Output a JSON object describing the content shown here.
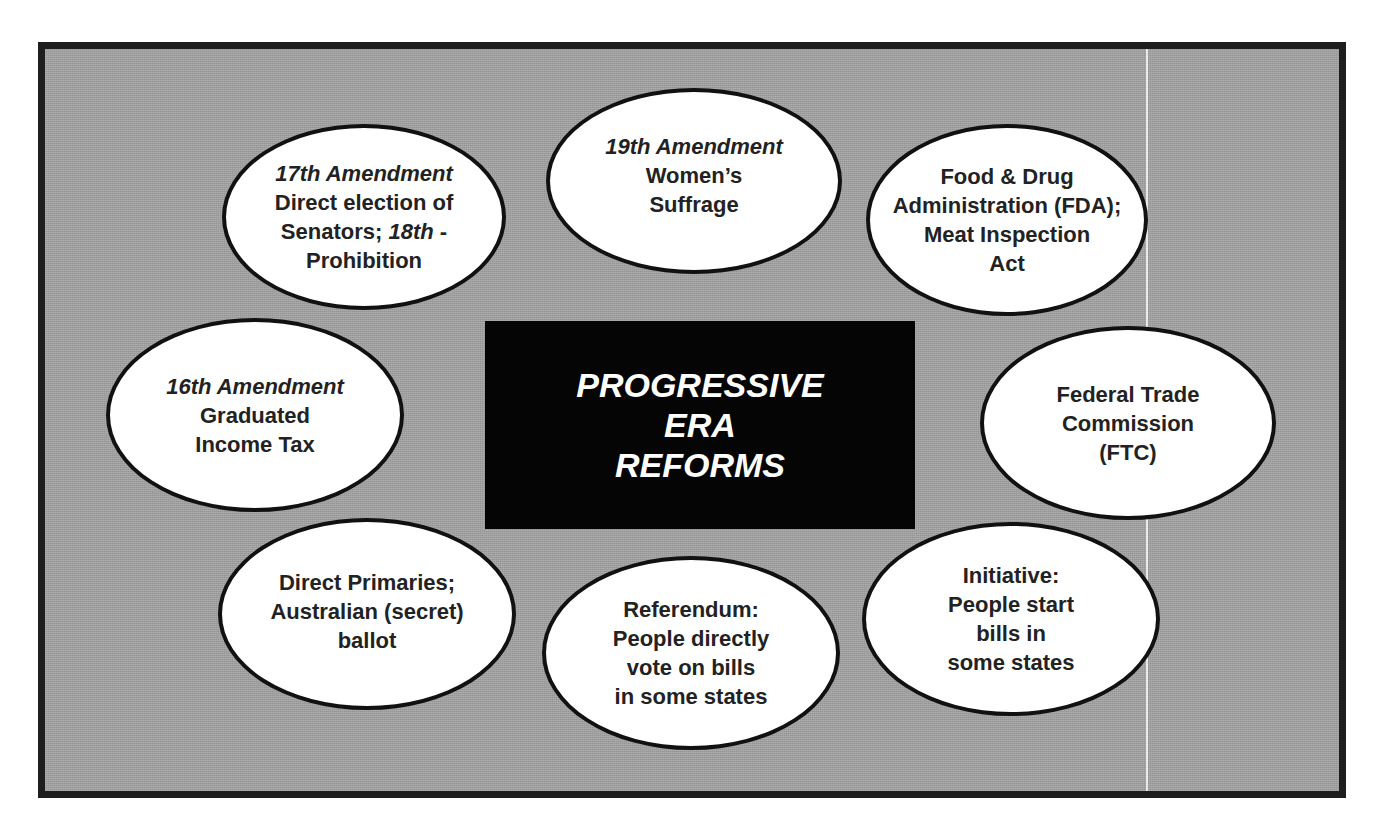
{
  "diagram": {
    "title": {
      "lines": [
        "PROGRESSIVE",
        "ERA",
        "REFORMS"
      ]
    },
    "colors": {
      "background": "#a3a3a3",
      "frame_border": "#1e1e1e",
      "title_box": "#050505",
      "title_text": "#ffffff",
      "oval_fill": "#ffffff",
      "oval_border": "#111111",
      "oval_text": "#222222"
    },
    "ovals": [
      {
        "id": "17th-18th-amendment",
        "lines": [
          {
            "italic": "17th Amendment",
            "text": ""
          },
          {
            "italic": "",
            "text": "Direct election of"
          },
          {
            "italic_prefix": "",
            "text": "Senators; ",
            "italic": "18th",
            "suffix": " -"
          },
          {
            "italic": "",
            "text": "Prohibition"
          }
        ]
      },
      {
        "id": "19th-amendment",
        "lines": [
          {
            "italic": "19th Amendment",
            "text": ""
          },
          {
            "italic": "",
            "text": "Women’s"
          },
          {
            "italic": "",
            "text": "Suffrage"
          }
        ]
      },
      {
        "id": "fda",
        "lines": [
          {
            "text": "Food & Drug"
          },
          {
            "text": "Administration (FDA);"
          },
          {
            "text": "Meat Inspection"
          },
          {
            "text": "Act"
          }
        ]
      },
      {
        "id": "16th-amendment",
        "lines": [
          {
            "italic": "16th Amendment",
            "text": ""
          },
          {
            "text": "Graduated"
          },
          {
            "text": "Income Tax"
          }
        ]
      },
      {
        "id": "ftc",
        "lines": [
          {
            "text": "Federal Trade"
          },
          {
            "text": "Commission"
          },
          {
            "text": "(FTC)"
          }
        ]
      },
      {
        "id": "direct-primaries",
        "lines": [
          {
            "text": "Direct Primaries;"
          },
          {
            "text": "Australian (secret)"
          },
          {
            "text": "ballot"
          }
        ]
      },
      {
        "id": "referendum",
        "lines": [
          {
            "text": "Referendum:"
          },
          {
            "text": "People directly"
          },
          {
            "text": "vote on bills"
          },
          {
            "text": "in some states"
          }
        ]
      },
      {
        "id": "initiative",
        "lines": [
          {
            "text": "Initiative:"
          },
          {
            "text": "People start"
          },
          {
            "text": "bills in"
          },
          {
            "text": "some states"
          }
        ]
      }
    ]
  }
}
